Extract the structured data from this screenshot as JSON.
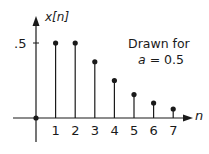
{
  "chart_data": {
    "type": "stem",
    "title": "",
    "ylabel": "x[n]",
    "xlabel": "n",
    "x": [
      0,
      1,
      2,
      3,
      4,
      5,
      6,
      7
    ],
    "values": [
      0,
      0.5,
      0.5,
      0.375,
      0.25,
      0.156,
      0.1,
      0.06
    ],
    "x_tick_labels": [
      "1",
      "2",
      "3",
      "4",
      "5",
      "6",
      "7"
    ],
    "y_tick_labels": [
      ".5"
    ],
    "annotation": [
      "Drawn for",
      "a = 0.5"
    ],
    "grid": false,
    "ylim": [
      -0.15,
      0.65
    ],
    "xlim": [
      -1,
      8
    ]
  },
  "labels": {
    "ylabel": "x[n]",
    "xlabel": "n",
    "ytick": ".5",
    "annotation_line1": "Drawn for",
    "annotation_a": "a",
    "annotation_rest": " = 0.5",
    "ticks": [
      "1",
      "2",
      "3",
      "4",
      "5",
      "6",
      "7"
    ]
  },
  "colors": {
    "ink": "#1a1a1a",
    "background": "#ffffff"
  }
}
